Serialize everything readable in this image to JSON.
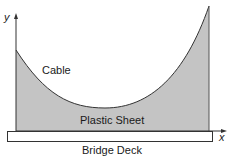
{
  "diagram": {
    "labels": {
      "cable": "Cable",
      "sheet": "Plastic Sheet",
      "deck": "Bridge Deck",
      "x_axis": "x",
      "y_axis": "y"
    },
    "colors": {
      "sheet_fill": "#c4c4c4",
      "stroke": "#333333",
      "deck_fill": "#ffffff"
    }
  }
}
